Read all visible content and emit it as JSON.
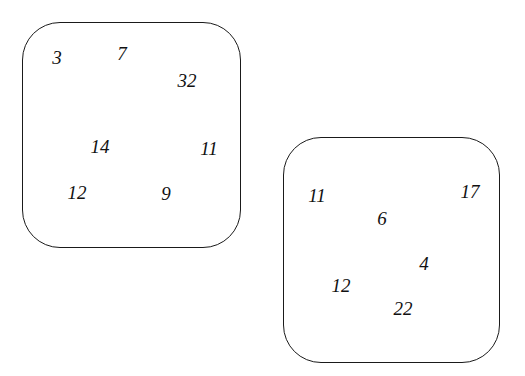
{
  "sets": [
    {
      "name": "left-set",
      "numbers": [
        {
          "value": "3",
          "x": 57,
          "y": 57
        },
        {
          "value": "7",
          "x": 122,
          "y": 53
        },
        {
          "value": "32",
          "x": 187,
          "y": 80
        },
        {
          "value": "14",
          "x": 100,
          "y": 146
        },
        {
          "value": "11",
          "x": 209,
          "y": 148
        },
        {
          "value": "12",
          "x": 77,
          "y": 192
        },
        {
          "value": "9",
          "x": 166,
          "y": 193
        }
      ]
    },
    {
      "name": "right-set",
      "numbers": [
        {
          "value": "11",
          "x": 317,
          "y": 195
        },
        {
          "value": "17",
          "x": 470,
          "y": 191
        },
        {
          "value": "6",
          "x": 382,
          "y": 218
        },
        {
          "value": "4",
          "x": 424,
          "y": 263
        },
        {
          "value": "12",
          "x": 341,
          "y": 285
        },
        {
          "value": "22",
          "x": 403,
          "y": 308
        }
      ]
    }
  ]
}
